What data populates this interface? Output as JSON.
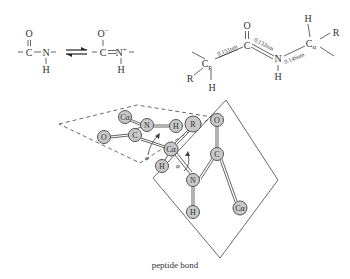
{
  "resonance": {
    "left": {
      "top_atom": "O",
      "center_atom": "C",
      "right_atom": "N",
      "bottom_atom": "H",
      "left_dash": "-",
      "right_dash": "-"
    },
    "equilibrium_arrow": "⇌",
    "right": {
      "top_atom": "O",
      "top_charge": "−",
      "center_atom": "C",
      "right_atom": "N",
      "right_charge": "+",
      "bottom_atom": "H",
      "left_dash": "-",
      "right_dash": "-"
    }
  },
  "bond_lengths": {
    "c_r": {
      "label": "C",
      "subscript": "R"
    },
    "carbonyl_o": "O",
    "carbonyl_c": "C",
    "amide_n": "N",
    "amide_h": "H",
    "c_alpha": {
      "label": "C",
      "subscript": "α"
    },
    "c_alpha_h": "H",
    "c_alpha_r": "R",
    "c_r_r": "R",
    "c_r_h": "H",
    "bond_1": "0.151nm",
    "bond_2": "0.132nm",
    "bond_3": "0.146nm"
  },
  "plane_model": {
    "atoms": [
      {
        "id": "ca1",
        "label": "Cα"
      },
      {
        "id": "n1",
        "label": "N"
      },
      {
        "id": "h1",
        "label": "H"
      },
      {
        "id": "r",
        "label": "R"
      },
      {
        "id": "o1",
        "label": "O"
      },
      {
        "id": "c1",
        "label": "C"
      },
      {
        "id": "ca_center",
        "label": "Cα"
      },
      {
        "id": "h_center",
        "label": "H"
      },
      {
        "id": "n2",
        "label": "N"
      },
      {
        "id": "h2",
        "label": "H"
      },
      {
        "id": "c2",
        "label": "C"
      },
      {
        "id": "o2",
        "label": "O"
      },
      {
        "id": "ca2",
        "label": "Cα"
      }
    ],
    "angle_phi": "φ",
    "angle_psi": "φ"
  },
  "caption": "peptide bond"
}
